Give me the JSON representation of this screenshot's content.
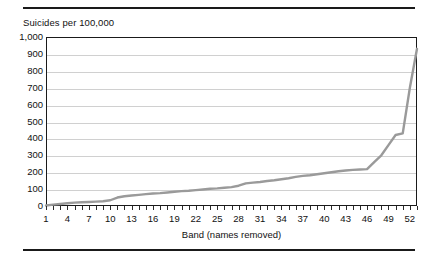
{
  "figure": {
    "title": "Suicides per 100,000",
    "top_rule": true,
    "bottom_rule": true,
    "line_color": "#9a9a9a",
    "gridline_color": "#d0d0d0",
    "axis_color": "#1a1a1a",
    "background": "#ffffff"
  },
  "chart_data": {
    "type": "line",
    "title": "Suicides per 100,000",
    "xlabel": "Band (names removed)",
    "ylabel": "",
    "ylim": [
      0,
      1000
    ],
    "xlim": [
      1,
      53
    ],
    "grid": true,
    "legend": "none",
    "ytick_labels": [
      "1,000",
      "900",
      "800",
      "700",
      "600",
      "500",
      "400",
      "300",
      "200",
      "100",
      "0"
    ],
    "ytick_values": [
      1000,
      900,
      800,
      700,
      600,
      500,
      400,
      300,
      200,
      100,
      0
    ],
    "xtick_labels": [
      "1",
      "4",
      "7",
      "10",
      "13",
      "16",
      "19",
      "22",
      "25",
      "28",
      "31",
      "34",
      "37",
      "40",
      "43",
      "46",
      "49",
      "52"
    ],
    "xtick_values": [
      1,
      4,
      7,
      10,
      13,
      16,
      19,
      22,
      25,
      28,
      31,
      34,
      37,
      40,
      43,
      46,
      49,
      52
    ],
    "x": [
      1,
      2,
      3,
      4,
      5,
      6,
      7,
      8,
      9,
      10,
      11,
      12,
      13,
      14,
      15,
      16,
      17,
      18,
      19,
      20,
      21,
      22,
      23,
      24,
      25,
      26,
      27,
      28,
      29,
      30,
      31,
      32,
      33,
      34,
      35,
      36,
      37,
      38,
      39,
      40,
      41,
      42,
      43,
      44,
      45,
      46,
      47,
      48,
      49,
      50,
      51,
      52,
      53
    ],
    "values": [
      3,
      8,
      12,
      16,
      20,
      22,
      24,
      26,
      28,
      34,
      50,
      58,
      62,
      66,
      70,
      74,
      76,
      80,
      84,
      88,
      90,
      94,
      98,
      102,
      104,
      108,
      112,
      120,
      134,
      138,
      142,
      148,
      152,
      158,
      164,
      172,
      178,
      182,
      188,
      194,
      200,
      206,
      210,
      214,
      216,
      218,
      260,
      300,
      360,
      420,
      430,
      700,
      930
    ],
    "series": [
      {
        "name": "Suicides per 100,000",
        "color": "#9a9a9a",
        "values": [
          3,
          8,
          12,
          16,
          20,
          22,
          24,
          26,
          28,
          34,
          50,
          58,
          62,
          66,
          70,
          74,
          76,
          80,
          84,
          88,
          90,
          94,
          98,
          102,
          104,
          108,
          112,
          120,
          134,
          138,
          142,
          148,
          152,
          158,
          164,
          172,
          178,
          182,
          188,
          194,
          200,
          206,
          210,
          214,
          216,
          218,
          260,
          300,
          360,
          420,
          430,
          700,
          930
        ]
      }
    ]
  }
}
